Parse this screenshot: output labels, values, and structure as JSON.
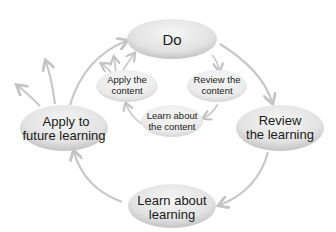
{
  "diagram": {
    "type": "cycle",
    "outer_cycle": {
      "nodes": [
        {
          "id": "do",
          "lines": [
            "Do"
          ]
        },
        {
          "id": "review-learning",
          "lines": [
            "Review",
            "the learning"
          ]
        },
        {
          "id": "learn-about-learning",
          "lines": [
            "Learn about",
            "learning"
          ]
        },
        {
          "id": "apply-future",
          "lines": [
            "Apply to",
            "future learning"
          ]
        }
      ]
    },
    "inner_cycle": {
      "nodes": [
        {
          "id": "review-content",
          "lines": [
            "Review the",
            "content"
          ]
        },
        {
          "id": "learn-content",
          "lines": [
            "Learn about",
            "the content"
          ]
        },
        {
          "id": "apply-content",
          "lines": [
            "Apply the",
            "content"
          ]
        }
      ]
    },
    "colors": {
      "node_fill_light": "#f2f2f2",
      "node_fill_dark": "#c8c8c8",
      "arrow": "#c4c4c4",
      "text": "#1a1a1a"
    }
  }
}
